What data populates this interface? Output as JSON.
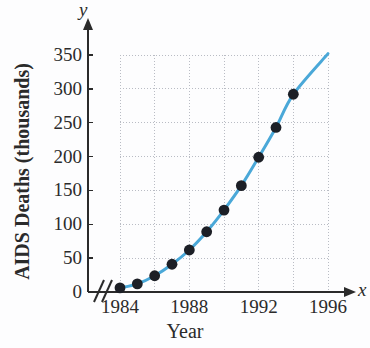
{
  "chart_data": {
    "type": "scatter",
    "title": "",
    "subtitle": "",
    "xlabel": "Year",
    "ylabel": "AIDS Deaths (thousands)",
    "x_axis_variable": "x",
    "y_axis_variable": "y",
    "xlim": [
      1983,
      1997
    ],
    "ylim": [
      0,
      360
    ],
    "grid": true,
    "legend": null,
    "axis_break": "//",
    "x_tick_labels": [
      "1984",
      "1988",
      "1992",
      "1996"
    ],
    "x_tick_values": [
      1984,
      1988,
      1992,
      1996
    ],
    "y_tick_labels": [
      "0",
      "50",
      "100",
      "150",
      "200",
      "250",
      "300",
      "350"
    ],
    "y_tick_values": [
      0,
      50,
      100,
      150,
      200,
      250,
      300,
      350
    ],
    "x_gridline_values": [
      1984,
      1986,
      1988,
      1990,
      1992,
      1994,
      1996
    ],
    "series": [
      {
        "name": "AIDS Deaths",
        "marker": "filled-circle",
        "marker_color": "#1c1f26",
        "line_color": "#4aa8d8",
        "x": [
          1984,
          1985,
          1986,
          1987,
          1988,
          1989,
          1990,
          1991,
          1992,
          1993,
          1994
        ],
        "values": [
          6,
          12,
          24,
          41,
          62,
          89,
          121,
          157,
          199,
          243,
          292
        ]
      }
    ],
    "curve_extends_to": {
      "x": 1996,
      "y": 352
    }
  },
  "labels": {
    "y_axis_title": "AIDS Deaths (thousands)",
    "x_axis_title": "Year",
    "y_var": "y",
    "x_var": "x"
  },
  "colors": {
    "curve": "#4aa8d8",
    "marker": "#1c1f26",
    "axis": "#2b2b2b",
    "grid": "#b9bcc4",
    "background": "#fdfdfe"
  }
}
